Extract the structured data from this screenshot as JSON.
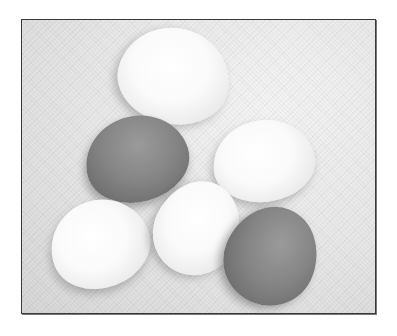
{
  "image": {
    "description": "Grayscale photograph of six eggs resting on a textured cloth, framed by a thin dark border",
    "style": "black-and-white",
    "colors": {
      "border": "#3a3a3a",
      "background_cloth": "#e6e6e6",
      "light_egg": "#fafafa",
      "dark_egg": "#7e7e7e"
    },
    "eggs": [
      {
        "id": "top-center",
        "tone": "light"
      },
      {
        "id": "middle-left",
        "tone": "dark"
      },
      {
        "id": "middle-right",
        "tone": "light"
      },
      {
        "id": "bottom-left",
        "tone": "light"
      },
      {
        "id": "bottom-center",
        "tone": "light"
      },
      {
        "id": "bottom-right",
        "tone": "dark"
      }
    ]
  }
}
